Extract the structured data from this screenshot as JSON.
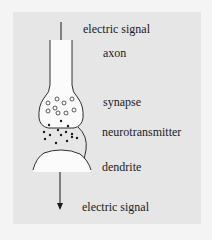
{
  "diagram": {
    "labels": {
      "top_signal": "electric signal",
      "axon": "axon",
      "synapse": "synapse",
      "neurotransmitter": "neurotransmitter",
      "dendrite": "dendrite",
      "bottom_signal": "electric signal"
    },
    "colors": {
      "background": "#e6e6e6",
      "structure_fill": "#fbfbfb",
      "ink": "#1a1a1a"
    }
  }
}
